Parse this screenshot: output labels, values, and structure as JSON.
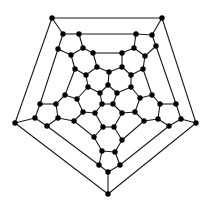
{
  "diagram": {
    "title": "",
    "type": "graph",
    "colors": {
      "background": "#ffffff",
      "edge": "#1a1a1a",
      "node": "#000000"
    },
    "node_radius": 2.7,
    "nodes": [
      {
        "id": 0,
        "x": 52,
        "y": 18
      },
      {
        "id": 1,
        "x": 162,
        "y": 18
      },
      {
        "id": 2,
        "x": 196,
        "y": 123
      },
      {
        "id": 3,
        "x": 108,
        "y": 194
      },
      {
        "id": 4,
        "x": 15,
        "y": 123
      },
      {
        "id": 5,
        "x": 63,
        "y": 34
      },
      {
        "id": 6,
        "x": 79,
        "y": 34
      },
      {
        "id": 7,
        "x": 136,
        "y": 34
      },
      {
        "id": 8,
        "x": 152,
        "y": 35
      },
      {
        "id": 9,
        "x": 156,
        "y": 46
      },
      {
        "id": 10,
        "x": 181,
        "y": 119
      },
      {
        "id": 11,
        "x": 169,
        "y": 126
      },
      {
        "id": 12,
        "x": 120,
        "y": 165
      },
      {
        "id": 13,
        "x": 108,
        "y": 172
      },
      {
        "id": 14,
        "x": 99,
        "y": 165
      },
      {
        "id": 15,
        "x": 47,
        "y": 126
      },
      {
        "id": 16,
        "x": 35,
        "y": 118
      },
      {
        "id": 17,
        "x": 58,
        "y": 49
      },
      {
        "id": 18,
        "x": 83,
        "y": 48
      },
      {
        "id": 19,
        "x": 71,
        "y": 55
      },
      {
        "id": 20,
        "x": 93,
        "y": 53
      },
      {
        "id": 21,
        "x": 122,
        "y": 53
      },
      {
        "id": 22,
        "x": 134,
        "y": 48
      },
      {
        "id": 23,
        "x": 145,
        "y": 56
      },
      {
        "id": 24,
        "x": 176,
        "y": 104
      },
      {
        "id": 25,
        "x": 160,
        "y": 104
      },
      {
        "id": 26,
        "x": 158,
        "y": 119
      },
      {
        "id": 27,
        "x": 115,
        "y": 152
      },
      {
        "id": 28,
        "x": 102,
        "y": 151
      },
      {
        "id": 29,
        "x": 40,
        "y": 104
      },
      {
        "id": 30,
        "x": 56,
        "y": 104
      },
      {
        "id": 31,
        "x": 58,
        "y": 118
      },
      {
        "id": 32,
        "x": 97,
        "y": 67
      },
      {
        "id": 33,
        "x": 122,
        "y": 67
      },
      {
        "id": 34,
        "x": 143,
        "y": 69
      },
      {
        "id": 35,
        "x": 75,
        "y": 69
      },
      {
        "id": 36,
        "x": 152,
        "y": 95
      },
      {
        "id": 37,
        "x": 144,
        "y": 121
      },
      {
        "id": 38,
        "x": 122,
        "y": 140
      },
      {
        "id": 39,
        "x": 94,
        "y": 137
      },
      {
        "id": 40,
        "x": 74,
        "y": 121
      },
      {
        "id": 41,
        "x": 65,
        "y": 95
      },
      {
        "id": 42,
        "x": 86,
        "y": 75
      },
      {
        "id": 43,
        "x": 109,
        "y": 72
      },
      {
        "id": 44,
        "x": 131,
        "y": 75
      },
      {
        "id": 45,
        "x": 140,
        "y": 98
      },
      {
        "id": 46,
        "x": 135,
        "y": 112
      },
      {
        "id": 47,
        "x": 114,
        "y": 127
      },
      {
        "id": 48,
        "x": 103,
        "y": 127
      },
      {
        "id": 49,
        "x": 83,
        "y": 112
      },
      {
        "id": 50,
        "x": 77,
        "y": 99
      },
      {
        "id": 51,
        "x": 88,
        "y": 87
      },
      {
        "id": 52,
        "x": 108,
        "y": 85
      },
      {
        "id": 53,
        "x": 131,
        "y": 87
      },
      {
        "id": 54,
        "x": 122,
        "y": 113
      },
      {
        "id": 55,
        "x": 95,
        "y": 113
      },
      {
        "id": 56,
        "x": 117,
        "y": 93
      },
      {
        "id": 57,
        "x": 100,
        "y": 93
      },
      {
        "id": 58,
        "x": 113,
        "y": 104
      },
      {
        "id": 59,
        "x": 102,
        "y": 104
      }
    ],
    "edges": [
      [
        0,
        1
      ],
      [
        1,
        2
      ],
      [
        2,
        3
      ],
      [
        3,
        4
      ],
      [
        4,
        0
      ],
      [
        0,
        5
      ],
      [
        1,
        8
      ],
      [
        2,
        10
      ],
      [
        3,
        13
      ],
      [
        4,
        16
      ],
      [
        5,
        6
      ],
      [
        6,
        7
      ],
      [
        7,
        8
      ],
      [
        8,
        9
      ],
      [
        9,
        24
      ],
      [
        24,
        10
      ],
      [
        10,
        11
      ],
      [
        11,
        12
      ],
      [
        12,
        13
      ],
      [
        13,
        14
      ],
      [
        14,
        15
      ],
      [
        15,
        16
      ],
      [
        16,
        29
      ],
      [
        29,
        17
      ],
      [
        17,
        5
      ],
      [
        6,
        18
      ],
      [
        18,
        19
      ],
      [
        19,
        17
      ],
      [
        18,
        20
      ],
      [
        7,
        22
      ],
      [
        22,
        21
      ],
      [
        22,
        23
      ],
      [
        23,
        9
      ],
      [
        24,
        25
      ],
      [
        25,
        26
      ],
      [
        26,
        11
      ],
      [
        12,
        27
      ],
      [
        27,
        28
      ],
      [
        28,
        14
      ],
      [
        15,
        31
      ],
      [
        31,
        30
      ],
      [
        30,
        29
      ],
      [
        20,
        32
      ],
      [
        21,
        33
      ],
      [
        20,
        21
      ],
      [
        23,
        34
      ],
      [
        19,
        35
      ],
      [
        25,
        36
      ],
      [
        26,
        37
      ],
      [
        27,
        38
      ],
      [
        28,
        39
      ],
      [
        31,
        40
      ],
      [
        30,
        41
      ],
      [
        32,
        43
      ],
      [
        33,
        43
      ],
      [
        32,
        42
      ],
      [
        42,
        35
      ],
      [
        33,
        44
      ],
      [
        44,
        34
      ],
      [
        34,
        36
      ],
      [
        36,
        45
      ],
      [
        45,
        53
      ],
      [
        37,
        46
      ],
      [
        37,
        38
      ],
      [
        38,
        47
      ],
      [
        39,
        48
      ],
      [
        39,
        40
      ],
      [
        40,
        49
      ],
      [
        41,
        50
      ],
      [
        41,
        35
      ],
      [
        50,
        51
      ],
      [
        51,
        42
      ],
      [
        44,
        53
      ],
      [
        45,
        46
      ],
      [
        46,
        54
      ],
      [
        47,
        48
      ],
      [
        47,
        54
      ],
      [
        48,
        55
      ],
      [
        49,
        55
      ],
      [
        49,
        50
      ],
      [
        43,
        52
      ],
      [
        52,
        56
      ],
      [
        52,
        57
      ],
      [
        51,
        57
      ],
      [
        53,
        56
      ],
      [
        54,
        58
      ],
      [
        55,
        59
      ],
      [
        56,
        58
      ],
      [
        57,
        59
      ],
      [
        58,
        59
      ]
    ]
  }
}
